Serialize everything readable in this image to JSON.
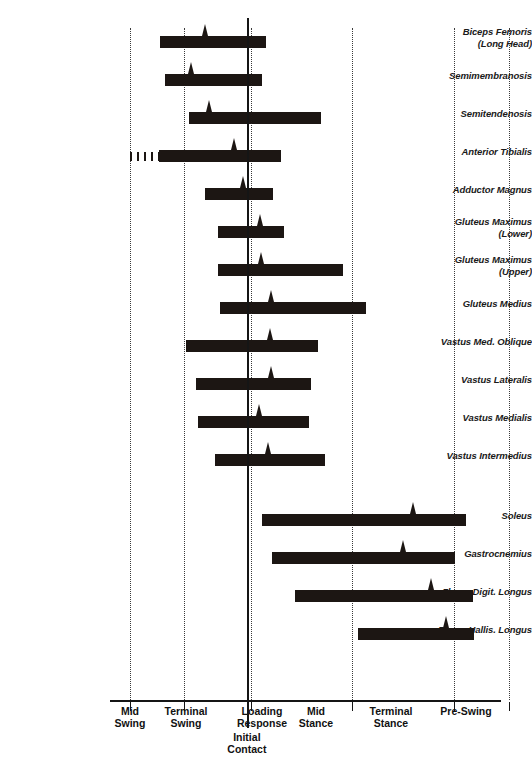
{
  "chart_data": {
    "type": "bar",
    "subtitle": "",
    "xlabel": "",
    "ylabel": "",
    "orientation": "horizontal",
    "xlim": [
      0,
      100
    ],
    "grid": true,
    "legend": false,
    "axis_note": "Horizontal span bars show EMG on-periods; small triangular spike marks peak activity.",
    "phases": [
      {
        "name": "Mid Swing",
        "label": "Mid\nSwing",
        "start": 0,
        "end": 14
      },
      {
        "name": "Terminal Swing",
        "label": "Terminal\nSwing",
        "start": 14,
        "end": 29
      },
      {
        "name": "Loading Response",
        "label": "Loading\nResponse",
        "start": 35,
        "end": 46
      },
      {
        "name": "Mid Stance",
        "label": "Mid\nStance",
        "start": 46,
        "end": 65
      },
      {
        "name": "Terminal Stance",
        "label": "Terminal\nStance",
        "start": 65,
        "end": 87
      },
      {
        "name": "Pre-Swing",
        "label": "Pre-Swing",
        "start": 87,
        "end": 100
      }
    ],
    "event_marker": {
      "name": "Initial Contact",
      "label": "Initial\nContact",
      "position": 35
    },
    "gridline_positions": [
      5,
      19,
      36,
      62,
      88,
      102
    ],
    "categories": [
      "Biceps Femoris (Long Head)",
      "Semimembranosis",
      "Semitendenosis",
      "Anterior Tibialis",
      "Adductor Magnus",
      "Gluteus Maximus (Lower)",
      "Gluteus Maximus (Upper)",
      "Gluteus Medius",
      "Vastus Med. Oblique",
      "Vastus Lateralis",
      "Vastus Medialis",
      "Vastus Intermedius",
      "Soleus",
      "Gastrocnemius",
      "Flexor Digit. Longus",
      "Flexor Hallis. Longus"
    ],
    "bars": [
      {
        "muscle": "Biceps Femoris (Long Head)",
        "label": "Biceps Femoris\n(Long Head)",
        "start": 12.8,
        "end": 40.0,
        "peak": 24.4,
        "lead_in": false
      },
      {
        "muscle": "Semimembranosis",
        "label": "Semimembranosis",
        "start": 14.1,
        "end": 38.9,
        "peak": 20.8,
        "lead_in": false
      },
      {
        "muscle": "Semitendenosis",
        "label": "Semitendenosis",
        "start": 20.3,
        "end": 54.0,
        "peak": 25.4,
        "lead_in": false
      },
      {
        "muscle": "Anterior Tibialis",
        "label": "Anterior Tibialis",
        "start": 12.6,
        "end": 43.8,
        "peak": 31.8,
        "lead_in": true,
        "lead_start": 5.1,
        "lead_end": 12.6
      },
      {
        "muscle": "Adductor Magnus",
        "label": "Adductor Magnus",
        "start": 24.4,
        "end": 41.8,
        "peak": 34.1,
        "lead_in": false
      },
      {
        "muscle": "Gluteus Maximus (Lower)",
        "label": "Gluteus Maximus\n(Lower)",
        "start": 27.7,
        "end": 44.4,
        "peak": 38.4,
        "lead_in": false
      },
      {
        "muscle": "Gluteus Maximus (Upper)",
        "label": "Gluteus Maximus\n(Upper)",
        "start": 27.7,
        "end": 59.7,
        "peak": 38.7,
        "lead_in": false
      },
      {
        "muscle": "Gluteus Medius",
        "label": "Gluteus Medius",
        "start": 28.2,
        "end": 65.6,
        "peak": 41.3,
        "lead_in": false
      },
      {
        "muscle": "Vastus Med. Oblique",
        "label": "Vastus Med. Oblique",
        "start": 19.5,
        "end": 53.3,
        "peak": 41.0,
        "lead_in": false
      },
      {
        "muscle": "Vastus Lateralis",
        "label": "Vastus Lateralis",
        "start": 22.1,
        "end": 51.3,
        "peak": 41.3,
        "lead_in": false
      },
      {
        "muscle": "Vastus Medialis",
        "label": "Vastus Medialis",
        "start": 22.6,
        "end": 50.8,
        "peak": 38.2,
        "lead_in": false
      },
      {
        "muscle": "Vastus Intermedius",
        "label": "Vastus Intermedius",
        "start": 26.9,
        "end": 55.1,
        "peak": 40.5,
        "lead_in": false
      },
      {
        "muscle": "Soleus",
        "label": "Soleus",
        "start": 39.0,
        "end": 91.0,
        "peak": 77.4,
        "lead_in": false
      },
      {
        "muscle": "Gastrocnemius",
        "label": "Gastrocnemius",
        "start": 41.5,
        "end": 88.2,
        "peak": 74.9,
        "lead_in": false
      },
      {
        "muscle": "Flexor Digit. Longus",
        "label": "Flexor Digit. Longus",
        "start": 47.2,
        "end": 92.8,
        "peak": 82.1,
        "lead_in": false
      },
      {
        "muscle": "Flexor Hallis. Longus",
        "label": "Flexor Hallis. Longus",
        "start": 63.3,
        "end": 93.1,
        "peak": 85.9,
        "lead_in": false
      }
    ]
  },
  "colors": {
    "bar": "#1c1613",
    "axis": "#151515",
    "gridline": "#3a3a3a",
    "text": "#1a1a1a",
    "background": "#ffffff"
  }
}
